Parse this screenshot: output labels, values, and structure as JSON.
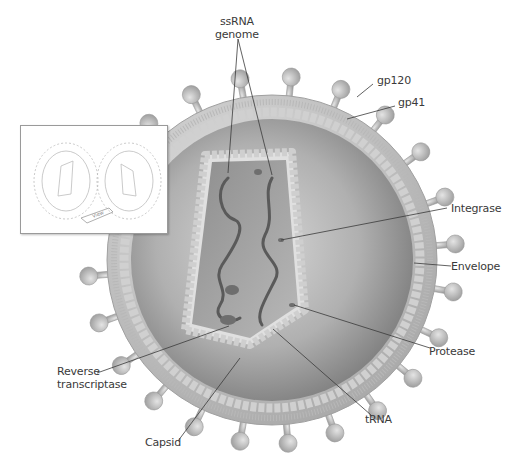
{
  "diagram": {
    "labels": {
      "ssrna": [
        "ssRNA",
        "genome"
      ],
      "gp120": "gp120",
      "gp41": "gp41",
      "integrase": "Integrase",
      "envelope": "Envelope",
      "protease": "Protease",
      "reverse_transcriptase": [
        "Reverse",
        "transcriptase"
      ],
      "trna": "tRNA",
      "capsid": "Capsid"
    },
    "inset": {
      "arrow_label": "View"
    },
    "colors": {
      "background": "#ffffff",
      "envelope": "#c9c9c9",
      "spike": "#b5b5b5",
      "interior": "#9a9a9a",
      "capsid_interior": "#8a8a8a",
      "rna": "#5a5a5a",
      "leader_line": "#3a3a3a",
      "label_text": "#3a3a3a"
    }
  }
}
